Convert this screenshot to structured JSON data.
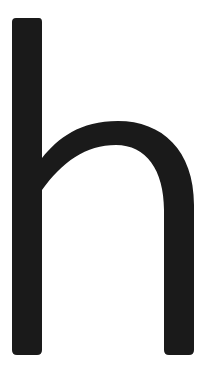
{
  "glyph": {
    "character": "h",
    "color": "#1a1a1a",
    "background": "#ffffff"
  }
}
